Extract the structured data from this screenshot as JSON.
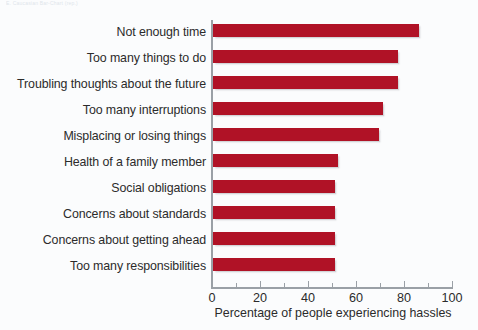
{
  "page": {
    "scan_artifact_text": "E. Caucasian Bar-Chart (rep.)"
  },
  "chart_data": {
    "type": "bar",
    "orientation": "horizontal",
    "title": "",
    "subtitle": "",
    "xlabel": "Percentage of people experiencing hassles",
    "ylabel": "",
    "xlim": [
      0,
      100
    ],
    "xticks": [
      0,
      20,
      40,
      60,
      80,
      100
    ],
    "xtick_labels": [
      "0",
      "20",
      "40",
      "60",
      "80",
      "100"
    ],
    "minor_xticks": [
      10,
      30,
      50,
      70,
      90
    ],
    "grid": false,
    "legend": false,
    "bar_color": "#b01226",
    "categories": [
      "Not enough time",
      "Too many things to do",
      "Troubling thoughts about the future",
      "Too many interruptions",
      "Misplacing or losing things",
      "Health of a family member",
      "Social obligations",
      "Concerns about standards",
      "Concerns about getting ahead",
      "Too many responsibilities"
    ],
    "values": [
      86,
      77,
      77,
      71,
      69,
      52,
      51,
      51,
      51,
      51
    ]
  }
}
